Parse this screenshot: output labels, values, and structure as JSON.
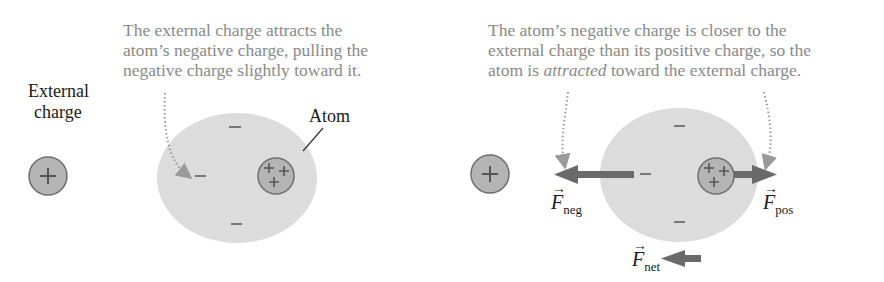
{
  "left_panel": {
    "caption_lines": [
      "The external charge attracts the",
      "atom’s negative charge, pulling the",
      "negative charge slightly toward it."
    ],
    "external_charge_label_lines": [
      "External",
      "charge"
    ],
    "atom_label": "Atom",
    "external_charge_symbol": "+",
    "nucleus_symbols": [
      "+",
      "+",
      "+"
    ],
    "electron_symbols": [
      "–",
      "–",
      "–"
    ]
  },
  "right_panel": {
    "caption_lines": [
      "The atom’s negative charge is closer to the",
      "external charge than its positive charge, so the"
    ],
    "caption_last_line": {
      "before": "atom is ",
      "emphasis": "attracted",
      "after": " toward the external charge."
    },
    "force_labels": {
      "neg": {
        "symbol": "F",
        "subscript": "neg"
      },
      "pos": {
        "symbol": "F",
        "subscript": "pos"
      },
      "net": {
        "symbol": "F",
        "subscript": "net"
      }
    },
    "vector_arrow": "→"
  },
  "colors": {
    "caption_text": "#8a8a8a",
    "electron_cloud": "#dcdcdc",
    "charge_fill": "#b4b4b4",
    "charge_stroke": "#6e6e6e",
    "force_arrow": "#6a6a6a",
    "pointer": "#9a9a9a"
  }
}
